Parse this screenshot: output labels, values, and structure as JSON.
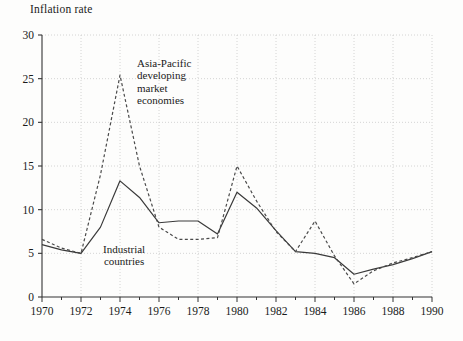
{
  "figure": {
    "axis_title": "Inflation rate",
    "annotations": [
      {
        "name": "asia-pacific",
        "text": "Asia-Pacific\ndeveloping\nmarket\neconomies"
      },
      {
        "name": "industrial",
        "text": "Industrial\ncountries"
      }
    ]
  },
  "chart_data": {
    "type": "line",
    "title": "Inflation rate",
    "xlabel": "",
    "ylabel": "Inflation rate",
    "xlim": [
      1970,
      1990
    ],
    "ylim": [
      0,
      30
    ],
    "ytick_labels": [
      "0",
      "5",
      "10",
      "15",
      "20",
      "25",
      "30"
    ],
    "yticks": [
      0,
      5,
      10,
      15,
      20,
      25,
      30
    ],
    "xtick_labels": [
      "1970",
      "1972",
      "1974",
      "1976",
      "1978",
      "1980",
      "1982",
      "1984",
      "1986",
      "1988",
      "1990"
    ],
    "xticks": [
      1970,
      1972,
      1974,
      1976,
      1978,
      1980,
      1982,
      1984,
      1986,
      1988,
      1990
    ],
    "minor_xticks_every": 1,
    "grid": true,
    "grid_style": "dotted",
    "grid_color": "#c9c9c9",
    "legend": "annotations",
    "x": [
      1970,
      1971,
      1972,
      1973,
      1974,
      1975,
      1976,
      1977,
      1978,
      1979,
      1980,
      1981,
      1982,
      1983,
      1984,
      1985,
      1986,
      1987,
      1988,
      1989,
      1990
    ],
    "series": [
      {
        "name": "Industrial countries",
        "style": "solid",
        "color": "#3a3a3a",
        "values": [
          6.0,
          5.4,
          5.0,
          8.0,
          13.3,
          11.4,
          8.5,
          8.7,
          8.7,
          7.2,
          12.0,
          10.2,
          7.6,
          5.2,
          5.0,
          4.5,
          2.6,
          3.2,
          3.7,
          4.4,
          5.2
        ]
      },
      {
        "name": "Asia-Pacific developing market economies",
        "style": "dashed",
        "color": "#4a4a4a",
        "values": [
          6.6,
          5.6,
          5.0,
          14.0,
          25.4,
          15.0,
          8.0,
          6.6,
          6.6,
          6.8,
          15.0,
          11.0,
          7.5,
          5.2,
          8.7,
          4.7,
          1.5,
          3.0,
          3.9,
          4.5,
          5.2
        ]
      }
    ]
  }
}
